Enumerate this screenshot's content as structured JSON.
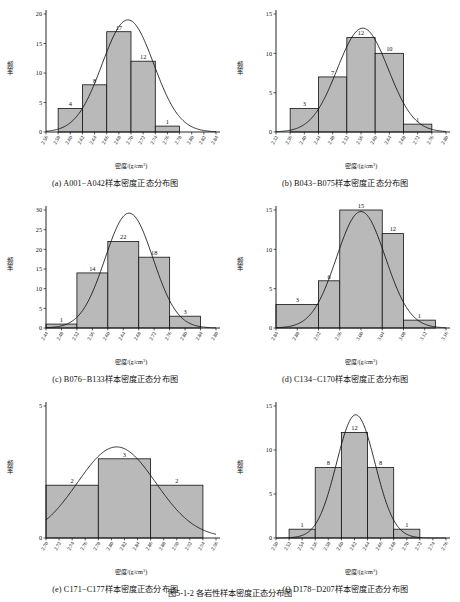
{
  "figure": {
    "bottom_caption": "图5-1-2  各岩性样本密度正态分布图",
    "axis_x_title": "密度/(g/cm",
    "axis_x_title_sup": "3",
    "axis_x_title_tail": ")",
    "axis_y_title": "频率"
  },
  "chart_data": [
    {
      "id": "a",
      "type": "bar",
      "title": "(a) A001−A042样本密度正态分布图",
      "xlabel": "密度/(g/cm3)",
      "ylabel": "频率",
      "ylim": [
        0,
        20
      ],
      "yticks": [
        0,
        5,
        10,
        15,
        20
      ],
      "xticks": [
        "2.56",
        "2.58",
        "2.60",
        "2.62",
        "2.64",
        "2.66",
        "2.68",
        "2.70",
        "2.72",
        "2.74",
        "2.76",
        "2.78",
        "2.80",
        "2.82",
        "2.84"
      ],
      "bin_edges": [
        2.58,
        2.62,
        2.66,
        2.7,
        2.74,
        2.78,
        2.82
      ],
      "values": [
        4,
        8,
        17,
        12,
        1
      ],
      "bar_labels": [
        "4",
        "8",
        "17",
        "12",
        "1"
      ],
      "curve": {
        "mean": 2.695,
        "sigma": 0.0425,
        "peak": 19.0
      },
      "grid": false,
      "legend": "none"
    },
    {
      "id": "b",
      "type": "bar",
      "title": "(b) B043−B075样本密度正态分布图",
      "xlabel": "密度/(g/cm3)",
      "ylabel": "频率",
      "ylim": [
        0,
        15
      ],
      "yticks": [
        0,
        5,
        10,
        15
      ],
      "xticks": [
        "2.32",
        "2.36",
        "2.40",
        "2.44",
        "2.48",
        "2.52",
        "2.56",
        "2.60",
        "2.64",
        "2.68",
        "2.72",
        "2.76",
        "2.80"
      ],
      "bin_edges": [
        2.36,
        2.44,
        2.52,
        2.6,
        2.68,
        2.76
      ],
      "values": [
        3,
        7,
        12,
        10,
        1
      ],
      "bar_labels": [
        "3",
        "7",
        "12",
        "10",
        "1"
      ],
      "curve": {
        "mean": 2.565,
        "sigma": 0.072,
        "peak": 13.2
      },
      "grid": false,
      "legend": "none"
    },
    {
      "id": "c",
      "type": "bar",
      "title": "(c) B076−B133样本密度正态分布图",
      "xlabel": "密度/(g/cm3)",
      "ylabel": "频率",
      "ylim": [
        0,
        30
      ],
      "yticks": [
        0,
        5,
        10,
        15,
        20,
        25,
        30
      ],
      "xticks": [
        "2.44",
        "2.48",
        "2.52",
        "2.56",
        "2.60",
        "2.64",
        "2.68",
        "2.72",
        "2.76",
        "2.80",
        "2.84",
        "2.88"
      ],
      "bin_edges": [
        2.44,
        2.52,
        2.6,
        2.68,
        2.76,
        2.84
      ],
      "values": [
        1,
        14,
        22,
        18,
        3
      ],
      "bar_labels": [
        "1",
        "14",
        "22",
        "18",
        "3"
      ],
      "curve": {
        "mean": 2.655,
        "sigma": 0.062,
        "peak": 29.2
      },
      "grid": false,
      "legend": "none"
    },
    {
      "id": "d",
      "type": "bar",
      "title": "(d) C134−C170样本密度正态分布图",
      "xlabel": "密度/(g/cm3)",
      "ylabel": "频率",
      "ylim": [
        0,
        15
      ],
      "yticks": [
        0,
        5,
        10,
        15
      ],
      "xticks": [
        "2.84",
        "2.88",
        "2.92",
        "2.96",
        "3.00",
        "3.04",
        "3.08",
        "3.12",
        "3.16"
      ],
      "bin_edges": [
        2.84,
        2.92,
        2.96,
        3.04,
        3.08,
        3.14
      ],
      "values": [
        3,
        6,
        15,
        12,
        1
      ],
      "bar_labels": [
        "3",
        "6",
        "15",
        "12",
        "1"
      ],
      "curve": {
        "mean": 3.0,
        "sigma": 0.046,
        "peak": 14.8
      },
      "grid": false,
      "legend": "none"
    },
    {
      "id": "e",
      "type": "bar",
      "title": "(e) C171−C177样本密度正态分布图",
      "xlabel": "密度/(g/cm3)",
      "ylabel": "频率",
      "ylim": [
        0,
        5
      ],
      "yticks": [
        0,
        5
      ],
      "xticks": [
        "2.70",
        "2.72",
        "2.74",
        "2.76",
        "2.78",
        "2.80",
        "2.82",
        "2.84",
        "2.86",
        "2.88",
        "2.90",
        "2.92",
        "2.94",
        "2.96"
      ],
      "bin_edges": [
        2.7,
        2.78,
        2.86,
        2.94
      ],
      "values": [
        2,
        3,
        2
      ],
      "bar_labels": [
        "2",
        "3",
        "2"
      ],
      "curve": {
        "mean": 2.808,
        "sigma": 0.06,
        "peak": 3.45
      },
      "grid": false,
      "legend": "none"
    },
    {
      "id": "f",
      "type": "bar",
      "title": "(f) D178−D207样本密度正态分布图",
      "xlabel": "密度/(g/cm3)",
      "ylabel": "频率",
      "ylim": [
        0,
        15
      ],
      "yticks": [
        0,
        5,
        10,
        15
      ],
      "xticks": [
        "2.50",
        "2.52",
        "2.54",
        "2.56",
        "2.58",
        "2.60",
        "2.62",
        "2.64",
        "2.66",
        "2.68",
        "2.70",
        "2.72",
        "2.74",
        "2.76"
      ],
      "bin_edges": [
        2.52,
        2.56,
        2.6,
        2.64,
        2.68,
        2.72
      ],
      "values": [
        1,
        8,
        12,
        8,
        1
      ],
      "bar_labels": [
        "1",
        "8",
        "12",
        "8",
        "1"
      ],
      "curve": {
        "mean": 2.622,
        "sigma": 0.0295,
        "peak": 14.0
      },
      "grid": false,
      "legend": "none"
    }
  ],
  "style": {
    "bar_fill": "#b9b9b9",
    "axis_color": "#111111",
    "curve_color": "#111111"
  }
}
